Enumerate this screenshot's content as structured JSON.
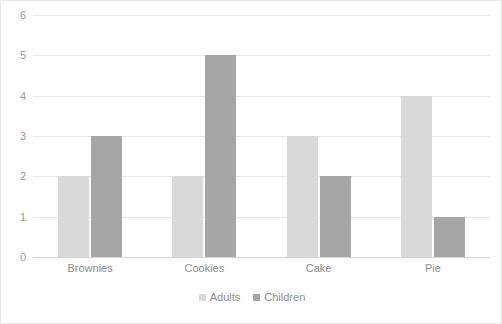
{
  "chart_data": {
    "type": "bar",
    "title": "",
    "subtitle": "",
    "xlabel": "",
    "ylabel": "",
    "categories": [
      "Brownies",
      "Cookies",
      "Cake",
      "Pie"
    ],
    "series": [
      {
        "name": "Adults",
        "values": [
          2,
          2,
          3,
          4
        ],
        "color": "#D9D9D9"
      },
      {
        "name": "Children",
        "values": [
          3,
          5,
          2,
          1
        ],
        "color": "#A6A6A6"
      }
    ],
    "ylim": [
      0,
      6
    ],
    "ytick_labels": [
      "0",
      "1",
      "2",
      "3",
      "4",
      "5",
      "6"
    ],
    "ytick_values": [
      0,
      1,
      2,
      3,
      4,
      5,
      6
    ],
    "grid": "horizontal",
    "legend_position": "bottom-center",
    "legend_marker": "square",
    "plot_border": "#E8E8E8",
    "gridline_color": "#E6E7E8",
    "axis_text_color": "#8E8E8E",
    "background": "#FFFFFF"
  }
}
